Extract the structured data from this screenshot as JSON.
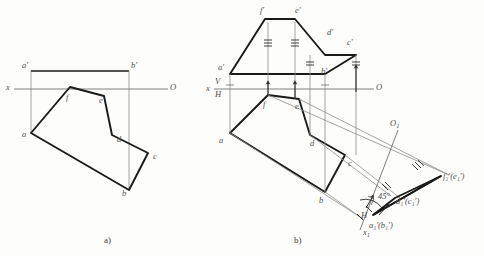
{
  "figure": {
    "title_a": "a)",
    "title_b": "b)"
  },
  "colors": {
    "object_line": "#1a1a1a",
    "thin_line": "#8c8c8c",
    "axis_line": "#6f6f6f",
    "label_text": "#4d4d4d",
    "caption_text": "#3d3d3d",
    "background": "#fdfdfc"
  },
  "diagram_a": {
    "caption": "a)",
    "axis": {
      "left_label": "x",
      "right_label": "O"
    },
    "vertices": [
      {
        "name": "a-prime-label",
        "text": "a'",
        "x": 22,
        "y": 66
      },
      {
        "name": "b-prime-label",
        "text": "b'",
        "x": 131,
        "y": 66
      },
      {
        "name": "f-label",
        "text": "f",
        "x": 66,
        "y": 98
      },
      {
        "name": "e-label",
        "text": "e",
        "x": 99,
        "y": 101
      },
      {
        "name": "a-label",
        "text": "a",
        "x": 24,
        "y": 135
      },
      {
        "name": "d-label",
        "text": "d",
        "x": 117,
        "y": 140
      },
      {
        "name": "c-label",
        "text": "c",
        "x": 156,
        "y": 158
      },
      {
        "name": "b-label",
        "text": "b",
        "x": 122,
        "y": 194
      }
    ]
  },
  "diagram_b": {
    "caption": "b)",
    "axis_main": {
      "left_label": "x",
      "upper_label": "V",
      "lower_label": "H",
      "right_label": "O"
    },
    "axis_aux": {
      "label_o1": "O",
      "sub_o1": "1",
      "label_x1": "x",
      "sub_x1": "1",
      "label_h": "H"
    },
    "angle_label": "45°",
    "v_projection_labels": [
      {
        "name": "f-prime-label",
        "text": "f'",
        "x": 261,
        "y": 9
      },
      {
        "name": "e-prime-label",
        "text": "e'",
        "x": 297,
        "y": 9
      },
      {
        "name": "d-prime-label",
        "text": "d'",
        "x": 329,
        "y": 30
      },
      {
        "name": "c-prime-label",
        "text": "c'",
        "x": 347,
        "y": 40
      },
      {
        "name": "a-prime-label-b",
        "text": "a'",
        "x": 219,
        "y": 66
      },
      {
        "name": "b-prime-label-b",
        "text": "b'",
        "x": 322,
        "y": 68
      }
    ],
    "h_projection_labels": [
      {
        "name": "f-label-b",
        "text": "f",
        "x": 263,
        "y": 104
      },
      {
        "name": "e-label-b",
        "text": "e",
        "x": 297,
        "y": 106
      },
      {
        "name": "a-label-b",
        "text": "a",
        "x": 221,
        "y": 140
      },
      {
        "name": "d-label-b",
        "text": "d",
        "x": 311,
        "y": 143
      },
      {
        "name": "c-label-b",
        "text": "c",
        "x": 349,
        "y": 163
      },
      {
        "name": "b-label-b",
        "text": "b",
        "x": 320,
        "y": 200
      }
    ],
    "aux_projection_labels": [
      {
        "name": "f1-e1-label",
        "text": "f₁'(e₁')",
        "x": 443,
        "y": 178
      },
      {
        "name": "d1-c1-label",
        "text": "d₁'(c₁')",
        "x": 396,
        "y": 201
      },
      {
        "name": "a1-b1-label",
        "text": "a₁'(b₁')",
        "x": 367,
        "y": 225
      }
    ]
  }
}
